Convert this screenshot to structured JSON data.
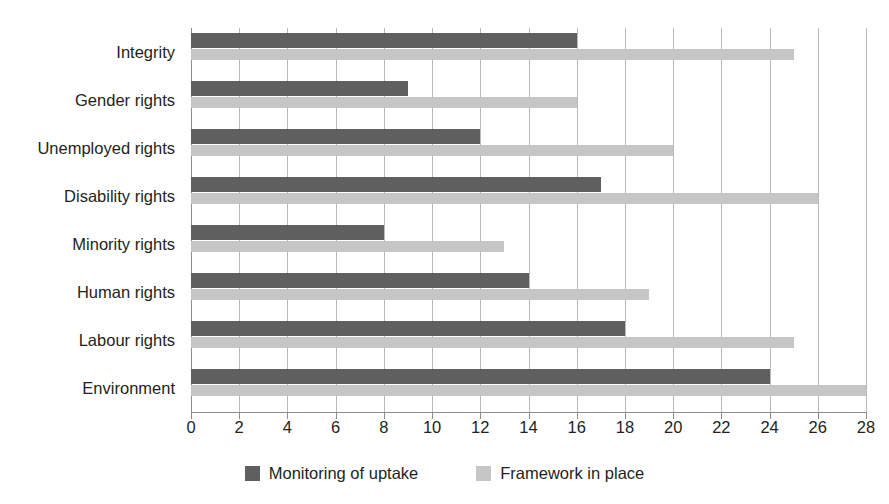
{
  "chart_data": {
    "type": "bar",
    "orientation": "horizontal",
    "title": "",
    "subtitle": "",
    "xlabel": "",
    "ylabel": "",
    "xlim": [
      0,
      28
    ],
    "xticks": [
      0,
      2,
      4,
      6,
      8,
      10,
      12,
      14,
      16,
      18,
      20,
      22,
      24,
      26,
      28
    ],
    "xtick_labels": [
      "0",
      "2",
      "4",
      "6",
      "8",
      "10",
      "12",
      "14",
      "16",
      "18",
      "20",
      "22",
      "24",
      "26",
      "28"
    ],
    "grid": "vertical",
    "legend_position": "bottom-center",
    "categories": [
      "Integrity",
      "Gender rights",
      "Unemployed rights",
      "Disability rights",
      "Minority rights",
      "Human rights",
      "Labour rights",
      "Environment"
    ],
    "series": [
      {
        "name": "Monitoring of uptake",
        "color": "#5f5f5f",
        "values": [
          16,
          9,
          12,
          17,
          8,
          14,
          18,
          24
        ]
      },
      {
        "name": "Framework in place",
        "color": "#c6c6c6",
        "values": [
          25,
          16,
          20,
          26,
          13,
          19,
          25,
          28
        ]
      }
    ]
  },
  "colors": {
    "series_dark": "#5f5f5f",
    "series_light": "#c6c6c6",
    "gridline": "#b9b9b9",
    "axis": "#8d8d8d",
    "text": "#231f20",
    "background": "#ffffff"
  },
  "legend": {
    "items": [
      {
        "label": "Monitoring of uptake",
        "swatch": "#5f5f5f"
      },
      {
        "label": "Framework in place",
        "swatch": "#c6c6c6"
      }
    ]
  }
}
